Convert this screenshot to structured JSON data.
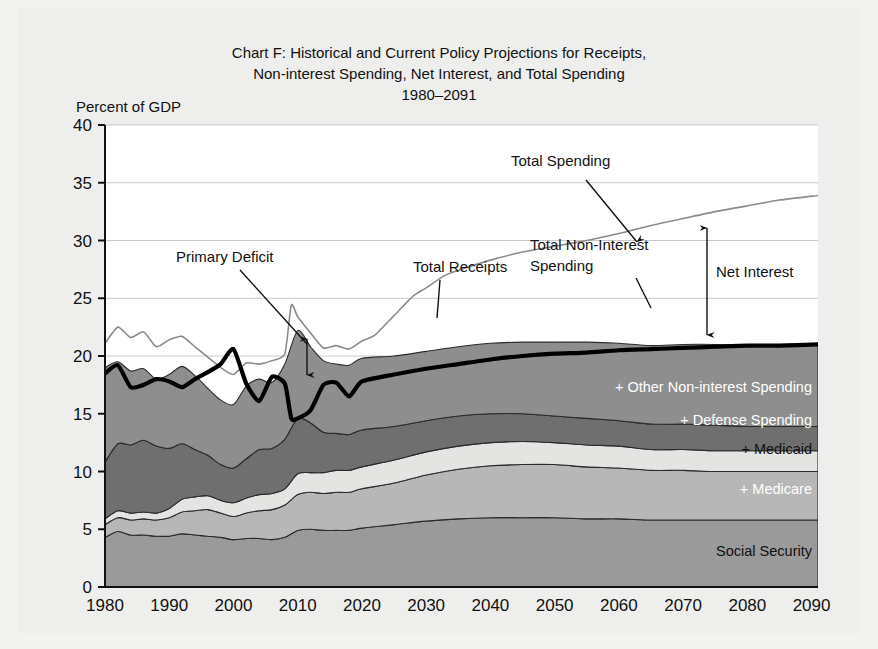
{
  "figure": {
    "title_lines": [
      "Chart F: Historical and Current Policy Projections for Receipts,",
      "Non-interest Spending, Net Interest, and Total Spending",
      "1980–2091"
    ],
    "y_axis_label": "Percent of GDP",
    "background_color": "#eeeeec",
    "plot_background_color": "#ffffff"
  },
  "chart_data": {
    "type": "area",
    "title": "Chart F: Historical and Current Policy Projections for Receipts, Non-interest Spending, Net Interest, and Total Spending 1980–2091",
    "xlabel": "",
    "ylabel": "Percent of GDP",
    "xlim": [
      1980,
      2091
    ],
    "ylim": [
      0,
      40
    ],
    "xticks": [
      1980,
      1990,
      2000,
      2010,
      2020,
      2030,
      2040,
      2050,
      2060,
      2070,
      2080,
      2090
    ],
    "yticks": [
      0,
      5,
      10,
      15,
      20,
      25,
      30,
      35,
      40
    ],
    "grid": true,
    "legend_position": "in-plot-labels",
    "stacked": true,
    "x": [
      1980,
      1982,
      1984,
      1986,
      1988,
      1990,
      1992,
      1994,
      1996,
      1998,
      2000,
      2002,
      2004,
      2006,
      2008,
      2010,
      2012,
      2014,
      2016,
      2018,
      2020,
      2025,
      2030,
      2035,
      2040,
      2045,
      2050,
      2055,
      2060,
      2065,
      2070,
      2075,
      2080,
      2085,
      2091
    ],
    "series": [
      {
        "name": "Social Security",
        "color": "#9a9a9a",
        "label": "Social Security",
        "label_color": "#111111",
        "values": [
          4.3,
          4.8,
          4.5,
          4.5,
          4.4,
          4.4,
          4.6,
          4.5,
          4.4,
          4.3,
          4.1,
          4.2,
          4.2,
          4.1,
          4.3,
          4.9,
          5.0,
          4.9,
          4.9,
          4.9,
          5.1,
          5.4,
          5.7,
          5.9,
          6.0,
          6.0,
          6.0,
          5.9,
          5.9,
          5.8,
          5.8,
          5.8,
          5.8,
          5.8,
          5.8
        ]
      },
      {
        "name": "+ Medicare",
        "color": "#b7b7b7",
        "label": "+ Medicare",
        "label_color": "#ffffff",
        "values": [
          1.1,
          1.2,
          1.3,
          1.4,
          1.4,
          1.6,
          1.9,
          2.1,
          2.3,
          2.1,
          2.0,
          2.2,
          2.4,
          2.6,
          2.8,
          3.1,
          3.2,
          3.2,
          3.3,
          3.3,
          3.4,
          3.6,
          4.0,
          4.3,
          4.5,
          4.6,
          4.6,
          4.5,
          4.4,
          4.3,
          4.3,
          4.2,
          4.2,
          4.2,
          4.2
        ]
      },
      {
        "name": "+ Medicaid",
        "color": "#e4e4e2",
        "label": "+ Medicaid",
        "label_color": "#111111",
        "values": [
          0.5,
          0.6,
          0.6,
          0.6,
          0.6,
          0.8,
          1.1,
          1.2,
          1.2,
          1.1,
          1.2,
          1.3,
          1.4,
          1.4,
          1.4,
          1.8,
          1.7,
          1.8,
          1.9,
          1.9,
          1.9,
          2.0,
          2.0,
          2.0,
          2.0,
          2.0,
          1.9,
          1.9,
          1.9,
          1.8,
          1.8,
          1.8,
          1.8,
          1.8,
          1.8
        ]
      },
      {
        "name": "+ Defense Spending",
        "color": "#6f6f6f",
        "label": "+ Defense Spending",
        "label_color": "#ffffff",
        "values": [
          4.9,
          5.8,
          5.9,
          6.2,
          5.8,
          5.2,
          4.8,
          4.1,
          3.5,
          3.1,
          3.0,
          3.4,
          3.9,
          3.9,
          4.3,
          4.8,
          4.3,
          3.5,
          3.2,
          3.1,
          3.2,
          2.9,
          2.7,
          2.6,
          2.5,
          2.4,
          2.3,
          2.3,
          2.2,
          2.2,
          2.2,
          2.2,
          2.1,
          2.1,
          2.1
        ]
      },
      {
        "name": "+ Other Non-interest Spending",
        "color": "#8e8e8e",
        "label": "+ Other Non-interest Spending",
        "label_color": "#ffffff",
        "values": [
          8.2,
          7.1,
          6.4,
          6.2,
          5.8,
          6.4,
          6.7,
          6.4,
          5.8,
          5.6,
          5.5,
          6.3,
          6.1,
          5.7,
          6.5,
          7.6,
          6.6,
          6.2,
          6.0,
          6.0,
          6.2,
          6.1,
          6.0,
          6.0,
          6.1,
          6.2,
          6.4,
          6.6,
          6.7,
          6.8,
          6.9,
          7.0,
          7.0,
          7.1,
          7.1
        ]
      }
    ],
    "lines": [
      {
        "name": "Total Spending",
        "style": "thin-gray",
        "color": "#8b8b8b",
        "width": 1.6,
        "x": [
          1980,
          1982,
          1984,
          1986,
          1988,
          1990,
          1992,
          1994,
          1996,
          1998,
          2000,
          2002,
          2004,
          2006,
          2008,
          2009,
          2010,
          2012,
          2014,
          2016,
          2018,
          2020,
          2022,
          2025,
          2028,
          2030,
          2033,
          2036,
          2040,
          2045,
          2050,
          2055,
          2060,
          2065,
          2070,
          2075,
          2080,
          2085,
          2091
        ],
        "values": [
          21.1,
          22.5,
          21.6,
          22.1,
          20.8,
          21.4,
          21.7,
          20.8,
          19.9,
          19.0,
          18.4,
          19.4,
          19.3,
          19.6,
          20.2,
          24.4,
          23.4,
          22.0,
          20.7,
          20.9,
          20.6,
          21.3,
          21.8,
          23.5,
          25.2,
          25.9,
          27.0,
          27.6,
          28.3,
          29.0,
          29.5,
          30.0,
          30.6,
          31.3,
          31.9,
          32.5,
          33.0,
          33.5,
          33.9
        ]
      },
      {
        "name": "Total Receipts",
        "style": "thick-black",
        "color": "#000000",
        "width": 4.2,
        "x": [
          1980,
          1982,
          1984,
          1986,
          1988,
          1990,
          1992,
          1994,
          1996,
          1998,
          2000,
          2002,
          2004,
          2006,
          2008,
          2009,
          2010,
          2012,
          2014,
          2016,
          2018,
          2020,
          2025,
          2030,
          2035,
          2040,
          2045,
          2050,
          2055,
          2060,
          2065,
          2070,
          2075,
          2080,
          2085,
          2091
        ],
        "values": [
          18.5,
          19.2,
          17.3,
          17.5,
          18.0,
          17.8,
          17.3,
          18.0,
          18.6,
          19.3,
          20.6,
          17.6,
          16.1,
          18.2,
          17.6,
          14.6,
          14.6,
          15.3,
          17.5,
          17.7,
          16.5,
          17.8,
          18.4,
          18.9,
          19.3,
          19.7,
          20.0,
          20.2,
          20.3,
          20.5,
          20.6,
          20.7,
          20.8,
          20.9,
          20.9,
          21.0
        ]
      }
    ],
    "annotations": [
      {
        "name": "total-spending",
        "text": "Total Spending",
        "x_px": 511,
        "y_px": 166,
        "anchor": "start",
        "pointer": {
          "type": "arrow-down",
          "x1": 586,
          "y1": 180,
          "x2": 637,
          "y2": 242
        }
      },
      {
        "name": "net-interest",
        "text": "Net Interest",
        "x_px": 716,
        "y_px": 277,
        "anchor": "start",
        "pointer": {
          "type": "double-arrow-vertical",
          "x": 707,
          "y1": 228,
          "y2": 335
        }
      },
      {
        "name": "total-non-interest-spending",
        "text_lines": [
          "Total Non-Interest",
          "Spending"
        ],
        "x_px": 530,
        "y_px": 250,
        "anchor": "start",
        "pointer": {
          "type": "leader",
          "x1": 636,
          "y1": 278,
          "x2": 651,
          "y2": 308
        }
      },
      {
        "name": "total-receipts",
        "text": "Total Receipts",
        "x_px": 413,
        "y_px": 272,
        "anchor": "start",
        "pointer": {
          "type": "leader",
          "x1": 440,
          "y1": 280,
          "x2": 437,
          "y2": 318
        }
      },
      {
        "name": "primary-deficit",
        "text": "Primary Deficit",
        "x_px": 176,
        "y_px": 262,
        "anchor": "start",
        "pointer": {
          "type": "leader",
          "x1": 240,
          "y1": 270,
          "x2": 307,
          "y2": 344
        },
        "gap_marker": {
          "type": "double-arrow-vertical",
          "x": 307,
          "y1": 339,
          "y2": 375
        }
      }
    ],
    "series_labels": [
      {
        "name": "other-non-interest-spending",
        "text": "+ Other Non-interest Spending",
        "x_px": 812,
        "y_px": 392,
        "fill": "#ffffff"
      },
      {
        "name": "defense-spending",
        "text": "+ Defense Spending",
        "x_px": 812,
        "y_px": 425,
        "fill": "#ffffff"
      },
      {
        "name": "medicaid",
        "text": "+ Medicaid",
        "x_px": 812,
        "y_px": 454,
        "fill": "#111111"
      },
      {
        "name": "medicare",
        "text": "+ Medicare",
        "x_px": 812,
        "y_px": 494,
        "fill": "#ffffff"
      },
      {
        "name": "social-security",
        "text": "Social Security",
        "x_px": 812,
        "y_px": 556,
        "fill": "#111111"
      }
    ]
  }
}
